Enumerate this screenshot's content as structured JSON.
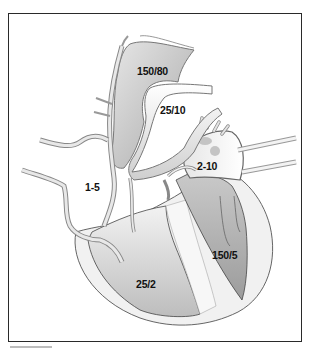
{
  "diagram": {
    "labels": {
      "aorta": "150/80",
      "pulmonary_artery": "25/10",
      "left_atrium": "2-10",
      "right_atrium": "1-5",
      "right_ventricle": "25/2",
      "left_ventricle": "150/5"
    },
    "colors": {
      "frame": "#2a2a2a",
      "vessel_wall": "#d9d9d9",
      "vessel_outline": "#8a8a8a",
      "aorta_fill": "#b9b9b9",
      "rv_fill": "#c8c8c8",
      "lv_fill": "#a9a9a9",
      "myocardium": "#efefef"
    }
  }
}
